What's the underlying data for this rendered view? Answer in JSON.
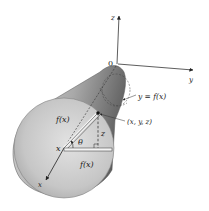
{
  "figure": {
    "axes": {
      "origin_label": "0",
      "x_label": "x",
      "y_label": "y",
      "z_label": "z"
    },
    "annotations": {
      "curve_label": "y = f(x)",
      "point_label": "(x, y, z)",
      "radius_label_slant": "f(x)",
      "radius_label_horizontal": "f(x)",
      "angle_label": "θ",
      "height_label": "z",
      "position_label": "x"
    },
    "colors": {
      "surface_dark": "#6e6e6e",
      "surface_light": "#d8d8d8",
      "disk_fill": "#c4c4c4",
      "line": "#222222"
    }
  }
}
